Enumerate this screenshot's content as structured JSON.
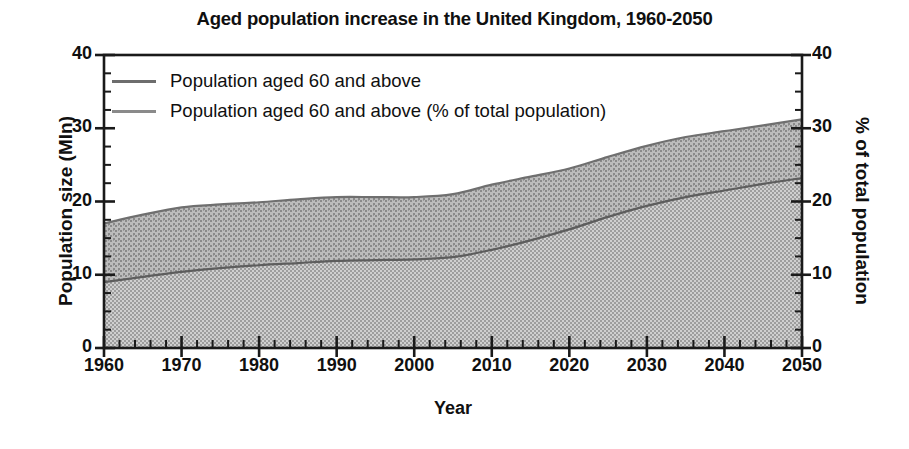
{
  "chart_data": {
    "type": "area",
    "title": "Aged population increase in the United Kingdom, 1960-2050",
    "xlabel": "Year",
    "ylabel": "Population size (Mln)",
    "ylabel_right": "% of total population",
    "xlim": [
      1960,
      2050
    ],
    "ylim": [
      0,
      40
    ],
    "ylim_right": [
      0,
      40
    ],
    "xticks": [
      1960,
      1970,
      1980,
      1990,
      2000,
      2010,
      2020,
      2030,
      2040,
      2050
    ],
    "yticks": [
      0,
      10,
      20,
      30,
      40
    ],
    "yticks_right": [
      0,
      10,
      20,
      30,
      40
    ],
    "minor_tick_every_x": 2,
    "minor_tick_every_y": 2.5,
    "grid": false,
    "legend_position": "top-left",
    "x": [
      1960,
      1965,
      1970,
      1975,
      1980,
      1985,
      1990,
      1995,
      2000,
      2005,
      2010,
      2015,
      2020,
      2025,
      2030,
      2035,
      2040,
      2045,
      2050
    ],
    "series": [
      {
        "name": "Population aged 60 and above",
        "axis": "left",
        "unit": "Mln",
        "fill": "dot-dense",
        "color": "#b7b7b7",
        "line_color": "#6d6d6d",
        "values": [
          9.0,
          9.7,
          10.4,
          10.9,
          11.3,
          11.6,
          11.9,
          12.0,
          12.1,
          12.4,
          13.4,
          14.7,
          16.2,
          17.9,
          19.4,
          20.6,
          21.5,
          22.4,
          23.2
        ]
      },
      {
        "name": "Population aged 60 and above (% of total population)",
        "axis": "right",
        "unit": "%",
        "fill": "dot-checker",
        "color": "#9a9a9a",
        "line_color": "#7a7a7a",
        "values": [
          17.0,
          18.2,
          19.2,
          19.6,
          19.9,
          20.3,
          20.6,
          20.6,
          20.6,
          21.0,
          22.3,
          23.4,
          24.5,
          26.1,
          27.6,
          28.8,
          29.6,
          30.4,
          31.2
        ]
      }
    ]
  },
  "legend": {
    "items": [
      {
        "label": "Population aged 60 and above"
      },
      {
        "label": "Population aged 60 and above (% of total population)"
      }
    ]
  }
}
